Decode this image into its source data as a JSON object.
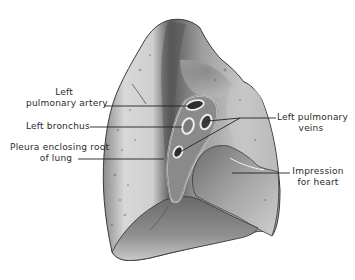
{
  "diagram": {
    "labels": [
      {
        "id": "left-pulmonary-artery",
        "lines": [
          "Left",
          "pulmonary artery"
        ]
      },
      {
        "id": "left-bronchus",
        "lines": [
          "Left bronchus"
        ]
      },
      {
        "id": "pleura-enclosing-root",
        "lines": [
          "Pleura enclosing root",
          "of lung"
        ]
      },
      {
        "id": "left-pulmonary-veins",
        "lines": [
          "Left pulmonary",
          "veins"
        ]
      },
      {
        "id": "impression-for-heart",
        "lines": [
          "Impression",
          "for heart"
        ]
      }
    ],
    "colors": {
      "background": "#ffffff",
      "lung_light": "#d9d9d9",
      "lung_mid": "#9a9a9a",
      "lung_dark": "#4a4a4a",
      "outline": "#3a3a3a",
      "leader_line": "#222222",
      "text": "#2a2a2a"
    }
  }
}
